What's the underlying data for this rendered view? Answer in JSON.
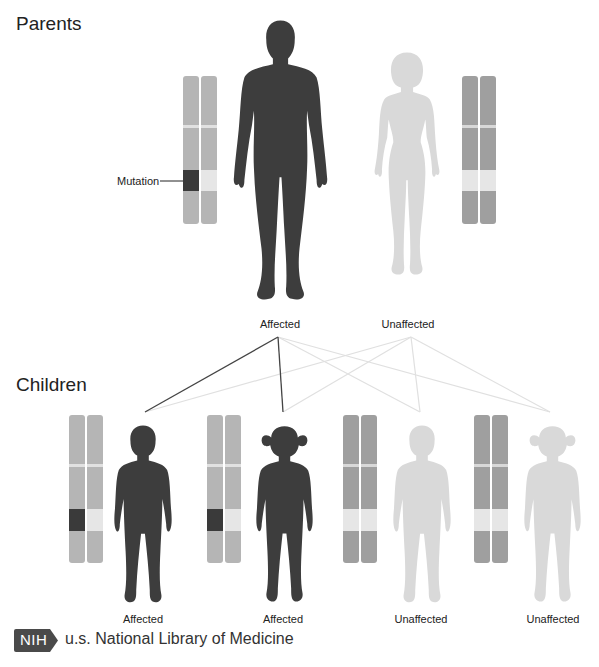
{
  "sections": {
    "parents_title": "Parents",
    "children_title": "Children"
  },
  "parents": {
    "father": {
      "label": "Affected",
      "status": "affected",
      "figure": "man"
    },
    "mother": {
      "label": "Unaffected",
      "status": "unaffected",
      "figure": "woman"
    },
    "mutation_label": "Mutation"
  },
  "children": [
    {
      "label": "Affected",
      "status": "affected",
      "figure": "boy"
    },
    {
      "label": "Affected",
      "status": "affected",
      "figure": "girl"
    },
    {
      "label": "Unaffected",
      "status": "unaffected",
      "figure": "boy"
    },
    {
      "label": "Unaffected",
      "status": "unaffected",
      "figure": "girl"
    }
  ],
  "footer": {
    "logo_badge": "NIH",
    "logo_text": "u.s. National Library of Medicine"
  },
  "colors": {
    "affected_figure": "#3d3d3d",
    "unaffected_figure": "#d9d9d9",
    "chromosome_light": "#b5b5b5",
    "chromosome_dark": "#9f9f9f",
    "mutation_band": "#3a3a3a",
    "normal_band": "#e6e6e6",
    "affected_line": "#444444",
    "unaffected_line": "#dddddd",
    "nih_badge": "#4a4a4a"
  }
}
